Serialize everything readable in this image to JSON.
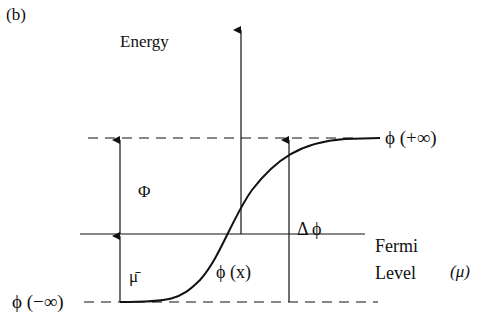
{
  "panel_label": "(b)",
  "axis": {
    "y_label": "Energy"
  },
  "levels": {
    "top": {
      "label": "ϕ (+∞)"
    },
    "fermi": {
      "label_line1": "Fermi",
      "label_line2": "Level",
      "symbol": "(μ)"
    },
    "bottom": {
      "label": "ϕ (−∞)"
    }
  },
  "quantities": {
    "work_function": "Φ",
    "mu_bar": "μ̄",
    "delta_phi": "Δ ϕ",
    "curve": "ϕ (x)"
  },
  "colors": {
    "ink": "#111111",
    "background": "#ffffff"
  }
}
